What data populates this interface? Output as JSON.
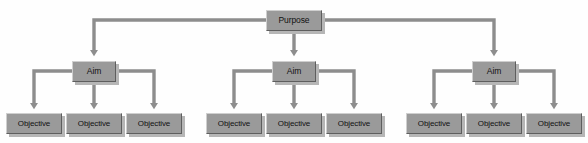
{
  "diagram": {
    "type": "hierarchy-tree",
    "colors": {
      "node_fill": "#9a9a9a",
      "node_highlight": "#cfcfcf",
      "node_shade": "#5e5e5e",
      "node_shadow": "#b6b6b6",
      "connector": "#8d8d8d",
      "background": "#fefefe",
      "text": "#111111"
    },
    "root": {
      "id": "purpose",
      "label": "Purpose"
    },
    "aims": [
      {
        "id": "aim-1",
        "label": "Aim"
      },
      {
        "id": "aim-2",
        "label": "Aim"
      },
      {
        "id": "aim-3",
        "label": "Aim"
      }
    ],
    "objectives": [
      {
        "id": "objective-1-1",
        "label": "Objective",
        "parent": "aim-1"
      },
      {
        "id": "objective-1-2",
        "label": "Objective",
        "parent": "aim-1"
      },
      {
        "id": "objective-1-3",
        "label": "Objective",
        "parent": "aim-1"
      },
      {
        "id": "objective-2-1",
        "label": "Objective",
        "parent": "aim-2"
      },
      {
        "id": "objective-2-2",
        "label": "Objective",
        "parent": "aim-2"
      },
      {
        "id": "objective-2-3",
        "label": "Objective",
        "parent": "aim-2"
      },
      {
        "id": "objective-3-1",
        "label": "Objective",
        "parent": "aim-3"
      },
      {
        "id": "objective-3-2",
        "label": "Objective",
        "parent": "aim-3"
      },
      {
        "id": "objective-3-3",
        "label": "Objective",
        "parent": "aim-3"
      }
    ]
  }
}
